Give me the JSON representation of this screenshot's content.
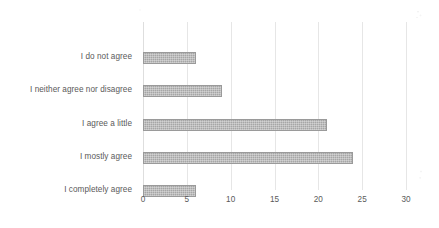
{
  "chart_data": {
    "type": "bar",
    "orientation": "horizontal",
    "title": "",
    "subtitle": "",
    "xlabel": "",
    "ylabel": "",
    "categories": [
      "I do not agree",
      "I neither agree nor disagree",
      "I agree a little",
      "I mostly agree",
      "I completely agree"
    ],
    "values": [
      6,
      9,
      21,
      24,
      6
    ],
    "xlim": [
      0,
      30
    ],
    "xticks": [
      0,
      5,
      10,
      15,
      20,
      25,
      30
    ],
    "xtick_labels": [
      "0",
      "5",
      "10",
      "15",
      "20",
      "25",
      "30"
    ],
    "grid": true,
    "grid_axis": "x",
    "legend": false,
    "legend_position": "none",
    "data_labels": false,
    "bar_color": "#a6a6a6",
    "bar_border_color": "#9a9a9a",
    "grid_color": "#e6e6e6",
    "text_color": "#5a5a5a",
    "background_color": "#ffffff"
  }
}
